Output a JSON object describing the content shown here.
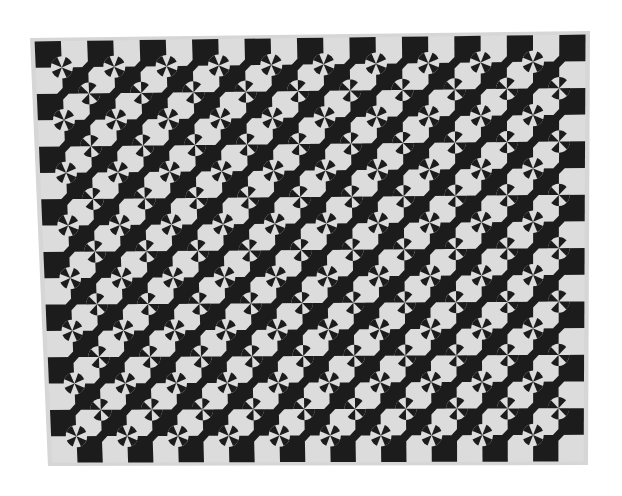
{
  "image": {
    "subject": "Black and white pieced quilt with checkerboard and pinwheel pattern",
    "background_color": "#ffffff",
    "quilt": {
      "dark_color": "#1e1e1e",
      "light_color": "#dcdcdc",
      "border_color": "#d6d6d6",
      "corners": {
        "top_left": [
          30,
          38
        ],
        "top_right": [
          590,
          31
        ],
        "bottom_right": [
          588,
          465
        ],
        "bottom_left": [
          48,
          466
        ]
      },
      "cell_size": 26.5,
      "columns": 21,
      "rows": 16,
      "motif": "pinwheel"
    }
  }
}
